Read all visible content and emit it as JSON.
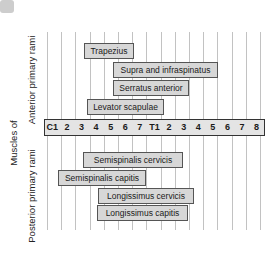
{
  "left_labels": {
    "group": "Muscles of",
    "anterior": "Anterior primary rami",
    "posterior": "Posterior primary rami"
  },
  "axis": {
    "description": "spinal segmental levels",
    "labels": [
      "C1",
      "2",
      "3",
      "4",
      "5",
      "6",
      "7",
      "T1",
      "2",
      "3",
      "4",
      "5",
      "6",
      "7",
      "8"
    ]
  },
  "anterior_muscles": [
    {
      "name": "Trapezius",
      "span_approx": "C3-C6"
    },
    {
      "name": "Supra and infraspinatus",
      "span_approx": "C5-T5"
    },
    {
      "name": "Serratus anterior",
      "span_approx": "C5-T3"
    },
    {
      "name": "Levator scapulae",
      "span_approx": "C3-T1"
    }
  ],
  "posterior_muscles": [
    {
      "name": "Semispinalis cervicis",
      "span_approx": "C3-T3"
    },
    {
      "name": "Semispinalis capitis",
      "span_approx": "C1-C7"
    },
    {
      "name": "Longissimus cervicis",
      "span_approx": "C4-T3"
    },
    {
      "name": "Longissimus capitis",
      "span_approx": "C4-T3"
    }
  ],
  "colors": {
    "background": "#ffffff",
    "bar_fill": "#d7d7d7",
    "bar_border": "#555555",
    "axis_fill": "#e4e4e4",
    "axis_border": "#333333",
    "gridline": "#c2c2c2",
    "text": "#222222",
    "corner_mark": "#cdcdcd"
  }
}
